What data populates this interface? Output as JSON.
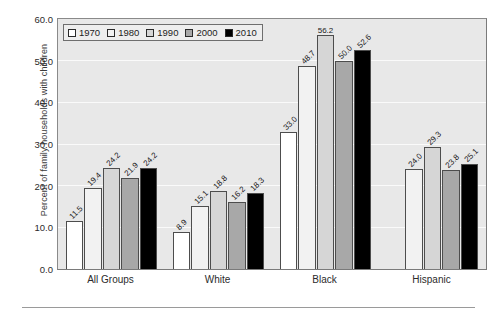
{
  "chart_data": {
    "type": "bar",
    "title": "",
    "xlabel": "",
    "ylabel": "Percent of family households with children",
    "ylim": [
      0,
      60
    ],
    "ytick_step": 10,
    "ytick_labels": [
      "0.0",
      "10.0",
      "20.0",
      "30.0",
      "40.0",
      "50.0",
      "60.0"
    ],
    "grid": true,
    "legend_position": "top-left",
    "categories": [
      "All Groups",
      "White",
      "Black",
      "Hispanic"
    ],
    "series": [
      {
        "name": "1970",
        "color": "#ffffff",
        "values": [
          11.5,
          8.9,
          33.0,
          null
        ]
      },
      {
        "name": "1980",
        "color": "#f2f2f2",
        "values": [
          19.4,
          15.1,
          48.7,
          24.0
        ]
      },
      {
        "name": "1990",
        "color": "#d6d6d6",
        "values": [
          24.2,
          18.8,
          56.2,
          29.3
        ]
      },
      {
        "name": "2000",
        "color": "#a8a8a8",
        "values": [
          21.9,
          16.2,
          50.0,
          23.8
        ]
      },
      {
        "name": "2010",
        "color": "#000000",
        "values": [
          24.2,
          18.3,
          52.6,
          25.1
        ]
      }
    ],
    "data_labels": {
      "All Groups": [
        "11.5",
        "19.4",
        "24.2",
        "21.9",
        "24.2"
      ],
      "White": [
        "8.9",
        "15.1",
        "18.8",
        "16.2",
        "18.3"
      ],
      "Black": [
        "33.0",
        "48.7",
        "56.2",
        "50.0",
        "52.6"
      ],
      "Hispanic": [
        null,
        "24.0",
        "29.3",
        "23.8",
        "25.1"
      ]
    }
  },
  "colors": {
    "plot_background": "#e8e8e8",
    "gridline": "#fafafa",
    "axis": "#7a7a7a",
    "bar_outline": "#4d4d4d",
    "text": "#1c1c1c"
  }
}
